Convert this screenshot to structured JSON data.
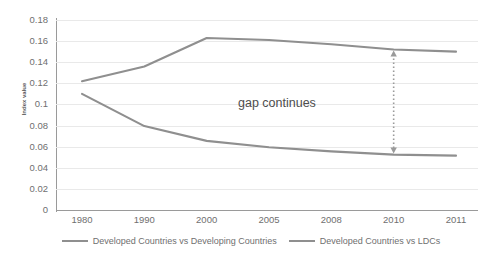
{
  "chart_data": {
    "type": "line",
    "title": "",
    "subtitle": "",
    "xlabel": "",
    "ylabel": "Index value",
    "categories": [
      "1980",
      "1990",
      "2000",
      "2005",
      "2008",
      "2010",
      "2011"
    ],
    "ylim": [
      0,
      0.18
    ],
    "ytick_step": 0.02,
    "yticks": [
      "0.18",
      "0.16",
      "0.14",
      "0.12",
      "0.1",
      "0.08",
      "0.06",
      "0.04",
      "0.02",
      "0"
    ],
    "grid": true,
    "grid_axis": "y",
    "legend_position": "bottom",
    "series": [
      {
        "name": "Developed Countries vs Developing Countries",
        "color": "#8f8f8f",
        "values": [
          0.122,
          0.136,
          0.163,
          0.161,
          0.157,
          0.152,
          0.15
        ]
      },
      {
        "name": "Developed Countries vs LDCs",
        "color": "#8f8f8f",
        "values": [
          0.11,
          0.0795,
          0.0655,
          0.0595,
          0.0555,
          0.0525,
          0.0515
        ]
      }
    ],
    "annotations": [
      {
        "text": "gap continues",
        "type": "double-arrow-dotted",
        "color": "#9a9a9a",
        "at_category": "2010"
      }
    ]
  },
  "legend": {
    "items": [
      {
        "label": "Developed Countries vs Developing Countries",
        "color": "#8f8f8f"
      },
      {
        "label": "Developed Countries vs LDCs",
        "color": "#8f8f8f"
      }
    ]
  }
}
